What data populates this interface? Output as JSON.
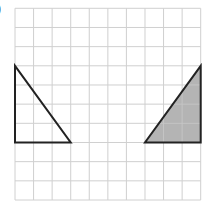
{
  "label": ")",
  "grid": {
    "cols": 10,
    "rows": 10,
    "origin_x": 15,
    "origin_y": 8.3,
    "cell_w": 18.57,
    "cell_h": 19.17,
    "line_color": "#c8c8c8"
  },
  "shapes": [
    {
      "name": "left-triangle",
      "fill": "none",
      "stroke": "#222222",
      "points_grid": [
        [
          0,
          3
        ],
        [
          0,
          7
        ],
        [
          3,
          7
        ]
      ]
    },
    {
      "name": "right-triangle-shaded",
      "fill": "#b4b4b4",
      "stroke": "#222222",
      "points_grid": [
        [
          7,
          7
        ],
        [
          10,
          7
        ],
        [
          10,
          3
        ]
      ]
    }
  ]
}
